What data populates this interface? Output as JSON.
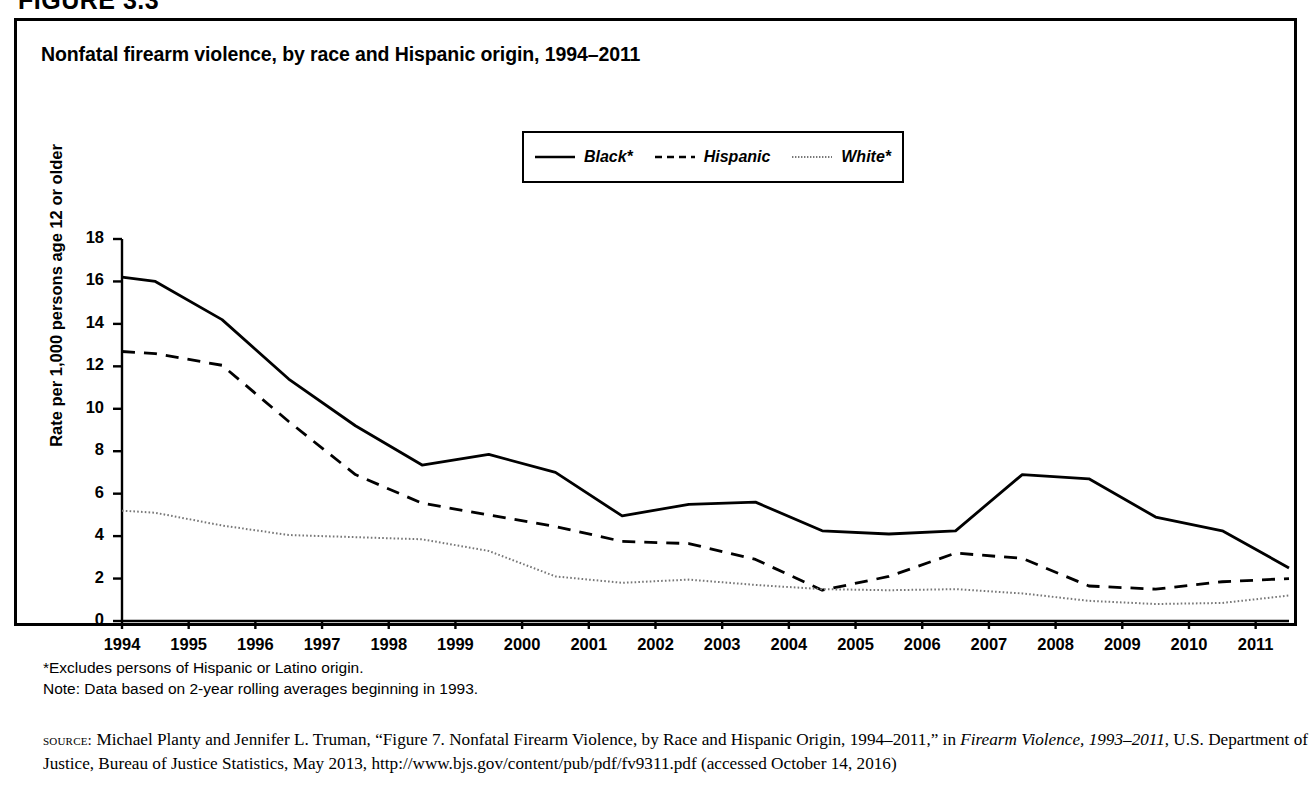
{
  "figure": {
    "number_label": "FIGURE 3.3"
  },
  "panel": {
    "title": "Nonfatal firearm violence, by race and Hispanic origin, 1994–2011"
  },
  "legend": {
    "items": [
      {
        "label": "Black*",
        "style": "solid",
        "color": "#000000"
      },
      {
        "label": "Hispanic",
        "style": "dashed",
        "color": "#000000"
      },
      {
        "label": "White*",
        "style": "dotted",
        "color": "#777777"
      }
    ]
  },
  "notes": {
    "line1": "*Excludes persons of Hispanic or Latino origin.",
    "line2": "Note: Data based on 2-year rolling averages beginning in 1993."
  },
  "source": {
    "kicker": "source:",
    "text_before_italic": " Michael Planty and Jennifer L. Truman, “Figure 7. Nonfatal Firearm Violence, by Race and Hispanic Origin, 1994–2011,” in ",
    "italic_title": "Firearm Violence, 1993–2011",
    "text_after_italic": ", U.S. Department of Justice, Bureau of Justice Statistics, May 2013, http://www.bjs.gov/content/pub/pdf/fv9311.pdf (accessed October 14, 2016)"
  },
  "chart_data": {
    "type": "line",
    "title": "Nonfatal firearm violence, by race and Hispanic origin, 1994–2011",
    "xlabel": "",
    "ylabel": "Rate per 1,000 persons age 12 or older",
    "xlim": [
      1994,
      2011.5
    ],
    "ylim": [
      0,
      18
    ],
    "ytick_values": [
      0,
      2,
      4,
      6,
      8,
      10,
      12,
      14,
      16,
      18
    ],
    "xtick_labels": [
      "1994",
      "1995",
      "1996",
      "1997",
      "1998",
      "1999",
      "2000",
      "2001",
      "2002",
      "2003",
      "2004",
      "2005",
      "2006",
      "2007",
      "2008",
      "2009",
      "2010",
      "2011"
    ],
    "grid": false,
    "legend_position": "top-center",
    "note": "Values are 2-year rolling averages; vertices fall at mid-year positions.",
    "x": [
      1994,
      1994.5,
      1995.5,
      1996.5,
      1997.5,
      1998.5,
      1999.5,
      2000.5,
      2001.5,
      2002.5,
      2003.5,
      2004.5,
      2005.5,
      2006.5,
      2007.5,
      2008.5,
      2009.5,
      2010.5,
      2011.5
    ],
    "series": [
      {
        "name": "Black*",
        "style": "solid",
        "color": "#000000",
        "values": [
          16.2,
          16.0,
          14.2,
          11.4,
          9.2,
          7.35,
          7.85,
          7.0,
          4.95,
          5.5,
          5.6,
          4.25,
          4.1,
          4.25,
          6.9,
          6.7,
          4.9,
          4.25,
          2.5
        ]
      },
      {
        "name": "Hispanic",
        "style": "dashed",
        "color": "#000000",
        "values": [
          12.7,
          12.6,
          12.05,
          9.4,
          6.9,
          5.55,
          5.0,
          4.45,
          3.75,
          3.65,
          2.9,
          1.45,
          2.1,
          3.2,
          2.95,
          1.65,
          1.5,
          1.85,
          2.0
        ]
      },
      {
        "name": "White*",
        "style": "dotted",
        "color": "#777777",
        "values": [
          5.2,
          5.1,
          4.5,
          4.05,
          3.95,
          3.85,
          3.3,
          2.1,
          1.8,
          1.95,
          1.7,
          1.5,
          1.45,
          1.5,
          1.3,
          0.95,
          0.8,
          0.85,
          1.2
        ]
      }
    ]
  }
}
